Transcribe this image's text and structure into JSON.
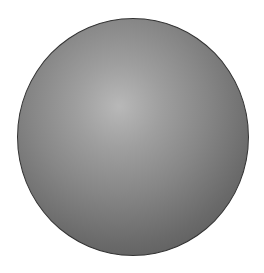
{
  "shape": {
    "type": "sphere",
    "colors": {
      "highlight": "#b8b8b8",
      "mid": "#868686",
      "edge": "#4e4e4e",
      "outline": "#333333",
      "background": "#ffffff"
    }
  }
}
